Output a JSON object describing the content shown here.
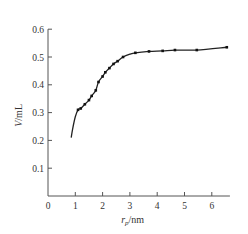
{
  "chart_data": {
    "type": "line",
    "title": "",
    "xlabel": "r_p/nm",
    "xlabel_main": "r",
    "xlabel_sub": "p",
    "xlabel_unit": "/nm",
    "ylabel": "V/mL",
    "ylabel_main": "V",
    "ylabel_unit": "/mL",
    "xlim": [
      0,
      6.7
    ],
    "ylim": [
      0,
      0.6
    ],
    "x_ticks": [
      "0",
      "1",
      "2",
      "3",
      "4",
      "5",
      "6"
    ],
    "y_ticks": [
      "0.1",
      "0.2",
      "0.3",
      "0.4",
      "0.5",
      "0.6"
    ],
    "grid": false,
    "legend": null,
    "series": [
      {
        "name": "measured points",
        "style": "markers",
        "x": [
          1.1,
          1.2,
          1.35,
          1.5,
          1.6,
          1.75,
          1.85,
          2.0,
          2.1,
          2.25,
          2.4,
          2.55,
          2.75,
          3.2,
          3.7,
          4.2,
          4.65,
          5.45,
          6.55
        ],
        "y": [
          0.31,
          0.315,
          0.33,
          0.345,
          0.36,
          0.38,
          0.41,
          0.43,
          0.445,
          0.46,
          0.475,
          0.485,
          0.5,
          0.515,
          0.52,
          0.522,
          0.525,
          0.525,
          0.535
        ]
      },
      {
        "name": "fitted curve",
        "style": "line",
        "x": [
          0.85,
          0.9,
          1.0,
          1.1,
          1.2,
          1.35,
          1.5,
          1.6,
          1.75,
          1.85,
          2.0,
          2.1,
          2.25,
          2.4,
          2.55,
          2.75,
          3.0,
          3.2,
          3.7,
          4.2,
          4.65,
          5.45,
          6.55
        ],
        "y": [
          0.21,
          0.24,
          0.285,
          0.31,
          0.315,
          0.33,
          0.345,
          0.36,
          0.38,
          0.41,
          0.43,
          0.445,
          0.46,
          0.475,
          0.485,
          0.5,
          0.51,
          0.515,
          0.52,
          0.522,
          0.525,
          0.525,
          0.535
        ]
      }
    ]
  }
}
